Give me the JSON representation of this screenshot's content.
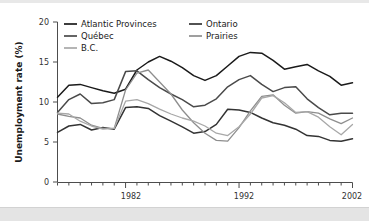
{
  "chart_data": {
    "type": "line",
    "title": "",
    "xlabel": "",
    "ylabel": "Unemployment rate (%)",
    "xlim": [
      1976,
      2002
    ],
    "ylim": [
      0,
      20
    ],
    "yticks": [
      0,
      5,
      10,
      15,
      20
    ],
    "ytick_labels": [
      "0",
      "5",
      "10",
      "15",
      "20"
    ],
    "xticks": [
      1982,
      1992,
      2002
    ],
    "xtick_labels": [
      "1982",
      "1992",
      "2002"
    ],
    "x_minor_tick_interval": 1,
    "grid": false,
    "legend_position": "upper-left-inside",
    "legend_columns": 2,
    "x": [
      1976,
      1977,
      1978,
      1979,
      1980,
      1981,
      1982,
      1983,
      1984,
      1985,
      1986,
      1987,
      1988,
      1989,
      1990,
      1991,
      1992,
      1993,
      1994,
      1995,
      1996,
      1997,
      1998,
      1999,
      2000,
      2001,
      2002
    ],
    "series": [
      {
        "name": "Atlantic Provinces",
        "color": "#1a1a1a",
        "values": [
          10.6,
          12.1,
          12.2,
          11.8,
          11.4,
          11.1,
          11.6,
          14.0,
          15.0,
          15.7,
          15.1,
          14.3,
          13.3,
          12.7,
          13.3,
          14.5,
          15.7,
          16.2,
          16.1,
          15.2,
          14.1,
          14.4,
          14.7,
          13.9,
          13.2,
          12.1,
          12.4
        ]
      },
      {
        "name": "Québec",
        "color": "#4a4a4a",
        "values": [
          8.7,
          10.3,
          11.0,
          9.8,
          9.9,
          10.3,
          13.8,
          13.9,
          12.8,
          11.8,
          11.0,
          10.3,
          9.4,
          9.6,
          10.4,
          11.9,
          12.8,
          13.3,
          12.2,
          11.3,
          11.8,
          11.9,
          10.4,
          9.3,
          8.4,
          8.6,
          8.6
        ]
      },
      {
        "name": "Ontario",
        "color": "#333333",
        "values": [
          6.2,
          7.0,
          7.2,
          6.5,
          6.8,
          6.6,
          9.3,
          9.4,
          9.2,
          8.3,
          7.6,
          6.9,
          6.1,
          6.3,
          7.2,
          9.1,
          9.0,
          8.7,
          8.0,
          7.4,
          7.1,
          6.6,
          5.8,
          5.7,
          5.2,
          5.1,
          5.4
        ]
      },
      {
        "name": "Prairies",
        "color": "#8e8e8e",
        "values": [
          8.5,
          8.2,
          8.0,
          7.1,
          6.7,
          6.7,
          11.5,
          13.6,
          14.0,
          12.5,
          11.0,
          9.0,
          7.4,
          6.1,
          5.2,
          5.1,
          6.8,
          8.9,
          10.7,
          10.9,
          9.6,
          8.6,
          8.8,
          8.6,
          7.9,
          7.3,
          8.0
        ]
      },
      {
        "name": "B.C.",
        "color": "#a8a8a8",
        "values": [
          8.6,
          8.5,
          7.6,
          7.0,
          6.6,
          6.7,
          10.1,
          10.3,
          9.8,
          9.1,
          8.5,
          8.0,
          7.6,
          7.0,
          6.1,
          5.8,
          6.9,
          8.5,
          10.5,
          10.8,
          9.9,
          8.7,
          8.8,
          8.1,
          6.9,
          5.9,
          7.2
        ]
      }
    ]
  },
  "axis": {
    "y_title": "Unemployment rate (%)"
  },
  "legend": {
    "entries": [
      {
        "label": "Atlantic Provinces",
        "color": "#1a1a1a"
      },
      {
        "label": "Ontario",
        "color": "#333333"
      },
      {
        "label": "Québec",
        "color": "#4a4a4a"
      },
      {
        "label": "Prairies",
        "color": "#8e8e8e"
      },
      {
        "label": "B.C.",
        "color": "#a8a8a8"
      }
    ]
  }
}
